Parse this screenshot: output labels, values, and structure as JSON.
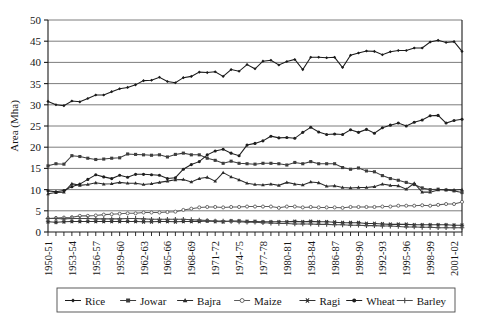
{
  "chart_data": {
    "type": "line",
    "title": "",
    "xlabel": "",
    "ylabel": "Area (Mha)",
    "ylim": [
      0,
      50
    ],
    "ytick_step": 5,
    "yticks": [
      0,
      5,
      10,
      15,
      20,
      25,
      30,
      35,
      40,
      45,
      50
    ],
    "grid": "horizontal",
    "legend_position": "bottom",
    "legend_border": true,
    "x": [
      "1950-51",
      "1951-52",
      "1952-53",
      "1953-54",
      "1954-55",
      "1955-56",
      "1956-57",
      "1957-58",
      "1958-59",
      "1959-60",
      "1960-61",
      "1961-62",
      "1962-63",
      "1963-64",
      "1964-65",
      "1965-66",
      "1966-67",
      "1967-68",
      "1968-69",
      "1969-70",
      "1970-71",
      "1971-72",
      "1972-73",
      "1973-74",
      "1974-75",
      "1975-76",
      "1976-77",
      "1977-78",
      "1978-79",
      "1979-80",
      "1980-81",
      "1981-82",
      "1982-83",
      "1983-84",
      "1984-85",
      "1985-86",
      "1986-87",
      "1987-88",
      "1988-89",
      "1989-90",
      "1990-91",
      "1991-92",
      "1992-93",
      "1993-94",
      "1994-95",
      "1995-96",
      "1996-97",
      "1997-98",
      "1998-99",
      "1999-00",
      "2000-01",
      "2001-02",
      "2002-03"
    ],
    "xtick_labels": [
      "1950-51",
      "1953-54",
      "1956-57",
      "1959-60",
      "1962-63",
      "1965-66",
      "1968-69",
      "1971-72",
      "1974-75",
      "1977-78",
      "1980-81",
      "1983-84",
      "1986-87",
      "1989-90",
      "1992-93",
      "1995-96",
      "1998-99",
      "2001-02"
    ],
    "xtick_every": 3,
    "series": [
      {
        "name": "Rice",
        "marker": "diamond",
        "color": "#1a1a1a",
        "values": [
          30.8,
          30.0,
          29.8,
          30.9,
          30.7,
          31.5,
          32.3,
          32.3,
          33.1,
          33.8,
          34.1,
          34.7,
          35.7,
          35.8,
          36.5,
          35.5,
          35.2,
          36.4,
          36.7,
          37.7,
          37.6,
          37.8,
          36.7,
          38.3,
          37.9,
          39.5,
          38.5,
          40.3,
          40.5,
          39.4,
          40.2,
          40.7,
          38.3,
          41.2,
          41.2,
          41.1,
          41.2,
          38.8,
          41.7,
          42.2,
          42.7,
          42.6,
          41.8,
          42.5,
          42.8,
          42.8,
          43.4,
          43.4,
          44.8,
          45.2,
          44.7,
          44.9,
          42.6
        ]
      },
      {
        "name": "Jowar",
        "marker": "square",
        "color": "#3d3d3d",
        "values": [
          15.6,
          16.1,
          16.0,
          18.0,
          17.8,
          17.4,
          17.1,
          17.2,
          17.4,
          17.5,
          18.4,
          18.3,
          18.2,
          18.1,
          18.2,
          17.7,
          18.3,
          18.6,
          18.2,
          18.2,
          17.4,
          16.9,
          16.2,
          16.7,
          16.2,
          16.1,
          16.0,
          16.2,
          16.2,
          16.1,
          15.8,
          16.4,
          16.1,
          16.6,
          16.1,
          16.1,
          16.1,
          15.2,
          14.8,
          15.1,
          14.4,
          14.2,
          13.3,
          12.6,
          12.2,
          11.7,
          11.2,
          10.4,
          10.0,
          10.1,
          9.9,
          9.7,
          9.3
        ]
      },
      {
        "name": "Bajra",
        "marker": "triangle",
        "color": "#2b2b2b",
        "values": [
          9.0,
          9.3,
          9.4,
          11.4,
          11.0,
          11.2,
          11.6,
          11.3,
          11.4,
          11.7,
          11.5,
          11.5,
          11.2,
          11.4,
          11.7,
          12.0,
          12.3,
          12.4,
          11.8,
          12.6,
          12.9,
          12.0,
          14.0,
          13.0,
          12.3,
          11.5,
          11.2,
          11.1,
          11.3,
          11.0,
          11.7,
          11.3,
          11.1,
          11.8,
          11.6,
          10.8,
          10.9,
          10.5,
          10.4,
          10.5,
          10.5,
          10.7,
          11.3,
          11.0,
          10.9,
          10.1,
          11.5,
          9.4,
          9.4,
          9.9,
          10.0,
          9.9,
          10.0
        ]
      },
      {
        "name": "Maize",
        "marker": "open-circle",
        "color": "#5c5c5c",
        "values": [
          3.2,
          3.3,
          3.4,
          3.5,
          3.8,
          3.8,
          3.9,
          4.1,
          4.2,
          4.3,
          4.4,
          4.4,
          4.6,
          4.6,
          4.6,
          4.7,
          4.8,
          5.2,
          5.5,
          5.8,
          5.9,
          5.9,
          5.8,
          5.9,
          5.9,
          6.0,
          6.0,
          6.0,
          6.0,
          5.7,
          6.0,
          6.0,
          5.8,
          5.9,
          5.8,
          5.8,
          5.8,
          5.7,
          5.9,
          5.9,
          5.9,
          5.9,
          6.0,
          6.0,
          6.2,
          6.2,
          6.2,
          6.3,
          6.2,
          6.4,
          6.6,
          6.6,
          7.1
        ]
      },
      {
        "name": "Ragi",
        "marker": "star",
        "color": "#333333",
        "values": [
          2.4,
          2.3,
          2.4,
          2.5,
          2.5,
          2.5,
          2.5,
          2.5,
          2.5,
          2.5,
          2.5,
          2.5,
          2.4,
          2.4,
          2.5,
          2.5,
          2.4,
          2.5,
          2.5,
          2.5,
          2.6,
          2.5,
          2.4,
          2.6,
          2.6,
          2.5,
          2.5,
          2.4,
          2.4,
          2.4,
          2.4,
          2.5,
          2.4,
          2.5,
          2.4,
          2.4,
          2.3,
          2.2,
          2.2,
          2.2,
          2.0,
          2.0,
          1.9,
          1.8,
          1.8,
          1.8,
          1.7,
          1.7,
          1.7,
          1.7,
          1.7,
          1.6,
          1.6
        ]
      },
      {
        "name": "Wheat",
        "marker": "circle",
        "color": "#1f1f1f",
        "values": [
          9.7,
          9.5,
          9.8,
          10.7,
          11.3,
          12.4,
          13.5,
          13.0,
          12.6,
          13.4,
          12.9,
          13.6,
          13.6,
          13.5,
          13.4,
          12.6,
          12.8,
          14.8,
          15.9,
          16.6,
          18.2,
          19.1,
          19.5,
          18.6,
          18.0,
          20.5,
          20.9,
          21.5,
          22.6,
          22.2,
          22.3,
          22.1,
          23.5,
          24.7,
          23.6,
          23.0,
          23.1,
          23.0,
          24.1,
          23.5,
          24.2,
          23.3,
          24.6,
          25.2,
          25.7,
          25.0,
          25.9,
          26.4,
          27.4,
          27.5,
          25.7,
          26.3,
          26.6
        ]
      },
      {
        "name": "Barley",
        "marker": "plus",
        "color": "#4a4a4a",
        "values": [
          3.2,
          3.2,
          3.1,
          3.2,
          3.2,
          3.2,
          3.1,
          3.1,
          3.1,
          3.1,
          3.2,
          3.2,
          3.1,
          3.0,
          3.0,
          3.0,
          3.0,
          3.0,
          2.9,
          2.8,
          2.7,
          2.6,
          2.6,
          2.5,
          2.4,
          2.3,
          2.3,
          2.2,
          2.1,
          2.0,
          2.0,
          1.9,
          1.9,
          1.9,
          1.8,
          1.8,
          1.7,
          1.7,
          1.6,
          1.6,
          1.5,
          1.5,
          1.4,
          1.4,
          1.3,
          1.2,
          1.2,
          1.1,
          1.1,
          1.0,
          1.0,
          1.0,
          1.0
        ]
      }
    ]
  },
  "legend": {
    "items": [
      {
        "label": "Rice"
      },
      {
        "label": "Jowar"
      },
      {
        "label": "Bajra"
      },
      {
        "label": "Maize"
      },
      {
        "label": "Ragi"
      },
      {
        "label": "Wheat"
      },
      {
        "label": "Barley"
      }
    ]
  },
  "style": {
    "grid_color": "#6e6e6e",
    "axis_color": "#1a1a1a",
    "background": "#ffffff"
  }
}
